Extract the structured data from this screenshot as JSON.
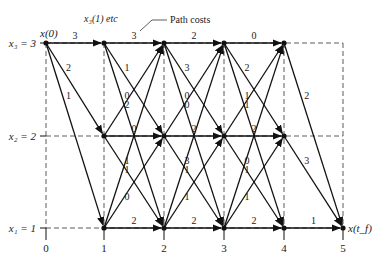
{
  "annotations": {
    "x_stage_label": "x₃(1) etc",
    "path_costs": "Path costs",
    "start": "x(0)",
    "end": "x(t_f)"
  },
  "y_states": [
    {
      "label": "x₁ = 1",
      "value": 1
    },
    {
      "label": "x₂ = 2",
      "value": 2
    },
    {
      "label": "x₃ = 3",
      "value": 3
    }
  ],
  "stages": [
    "0",
    "1",
    "2",
    "3",
    "4",
    "5"
  ],
  "caption": "Fig. 11.2",
  "edges": [
    {
      "from": [
        0,
        3
      ],
      "to": [
        1,
        3
      ],
      "cost": "3"
    },
    {
      "from": [
        0,
        3
      ],
      "to": [
        1,
        2
      ],
      "cost": "2"
    },
    {
      "from": [
        0,
        3
      ],
      "to": [
        1,
        1
      ],
      "cost": "1"
    },
    {
      "from": [
        1,
        3
      ],
      "to": [
        2,
        3
      ],
      "cost": "3"
    },
    {
      "from": [
        1,
        3
      ],
      "to": [
        2,
        2
      ],
      "cost": "1"
    },
    {
      "from": [
        1,
        3
      ],
      "to": [
        2,
        1
      ],
      "cost": "0"
    },
    {
      "from": [
        1,
        2
      ],
      "to": [
        2,
        3
      ],
      "cost": "2"
    },
    {
      "from": [
        1,
        2
      ],
      "to": [
        2,
        2
      ],
      "cost": "0"
    },
    {
      "from": [
        1,
        2
      ],
      "to": [
        2,
        1
      ],
      "cost": "1"
    },
    {
      "from": [
        1,
        1
      ],
      "to": [
        2,
        3
      ],
      "cost": "1"
    },
    {
      "from": [
        1,
        1
      ],
      "to": [
        2,
        2
      ],
      "cost": "0"
    },
    {
      "from": [
        1,
        1
      ],
      "to": [
        2,
        1
      ],
      "cost": "2"
    },
    {
      "from": [
        2,
        3
      ],
      "to": [
        3,
        3
      ],
      "cost": "2"
    },
    {
      "from": [
        2,
        3
      ],
      "to": [
        3,
        2
      ],
      "cost": "3"
    },
    {
      "from": [
        2,
        3
      ],
      "to": [
        3,
        1
      ],
      "cost": "0"
    },
    {
      "from": [
        2,
        2
      ],
      "to": [
        3,
        3
      ],
      "cost": "0"
    },
    {
      "from": [
        2,
        2
      ],
      "to": [
        3,
        2
      ],
      "cost": "2"
    },
    {
      "from": [
        2,
        2
      ],
      "to": [
        3,
        1
      ],
      "cost": "3"
    },
    {
      "from": [
        2,
        1
      ],
      "to": [
        3,
        3
      ],
      "cost": "1"
    },
    {
      "from": [
        2,
        1
      ],
      "to": [
        3,
        2
      ],
      "cost": "1"
    },
    {
      "from": [
        2,
        1
      ],
      "to": [
        3,
        1
      ],
      "cost": "2"
    },
    {
      "from": [
        3,
        3
      ],
      "to": [
        4,
        3
      ],
      "cost": "0"
    },
    {
      "from": [
        3,
        3
      ],
      "to": [
        4,
        2
      ],
      "cost": "2"
    },
    {
      "from": [
        3,
        3
      ],
      "to": [
        4,
        1
      ],
      "cost": "1"
    },
    {
      "from": [
        3,
        2
      ],
      "to": [
        4,
        3
      ],
      "cost": "1"
    },
    {
      "from": [
        3,
        2
      ],
      "to": [
        4,
        2
      ],
      "cost": "2"
    },
    {
      "from": [
        3,
        2
      ],
      "to": [
        4,
        1
      ],
      "cost": "0"
    },
    {
      "from": [
        3,
        1
      ],
      "to": [
        4,
        3
      ],
      "cost": "1"
    },
    {
      "from": [
        3,
        1
      ],
      "to": [
        4,
        2
      ],
      "cost": "1"
    },
    {
      "from": [
        3,
        1
      ],
      "to": [
        4,
        1
      ],
      "cost": "2"
    },
    {
      "from": [
        4,
        3
      ],
      "to": [
        5,
        1
      ],
      "cost": "2"
    },
    {
      "from": [
        4,
        2
      ],
      "to": [
        5,
        1
      ],
      "cost": "3"
    },
    {
      "from": [
        4,
        1
      ],
      "to": [
        5,
        1
      ],
      "cost": "1"
    }
  ]
}
